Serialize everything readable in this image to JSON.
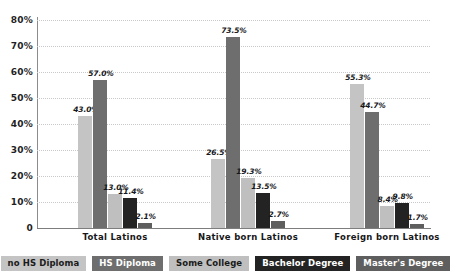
{
  "chart_data": {
    "type": "bar",
    "title": "",
    "subtitle": "",
    "xlabel": "",
    "ylabel": "",
    "ylim": [
      0,
      80
    ],
    "grid": true,
    "legend_position": "bottom",
    "categories": [
      "Total Latinos",
      "Native born Latinos",
      "Foreign born Latinos"
    ],
    "ytick_labels": [
      "80%",
      "70%",
      "60%",
      "50%",
      "40%",
      "30%",
      "20%",
      "10%",
      "0"
    ],
    "ytick_values": [
      80,
      70,
      60,
      50,
      40,
      30,
      20,
      10,
      0
    ],
    "series": [
      {
        "name": "no HS Diploma",
        "color": "#c4c4c4",
        "text_color": "#1a1a1a",
        "values": [
          43.0,
          26.5,
          55.3
        ],
        "labels": [
          "43.0%",
          "26.5%",
          "55.3%"
        ]
      },
      {
        "name": "HS Diploma",
        "color": "#6e6e6e",
        "text_color": "#ffffff",
        "values": [
          57.0,
          73.5,
          44.7
        ],
        "labels": [
          "57.0%",
          "73.5%",
          "44.7%"
        ]
      },
      {
        "name": "Some College",
        "color": "#bfbfbf",
        "text_color": "#1a1a1a",
        "values": [
          13.0,
          19.3,
          8.4
        ],
        "labels": [
          "13.0%",
          "19.3%",
          "8.4%"
        ]
      },
      {
        "name": "Bachelor Degree",
        "color": "#232323",
        "text_color": "#ffffff",
        "values": [
          11.4,
          13.5,
          9.8
        ],
        "labels": [
          "11.4%",
          "13.5%",
          "9.8%"
        ]
      },
      {
        "name": "Master's Degree",
        "color": "#5e5e5e",
        "text_color": "#ffffff",
        "values": [
          2.1,
          2.7,
          1.7
        ],
        "labels": [
          "2.1%",
          "2.7%",
          "1.7%"
        ]
      }
    ]
  },
  "legend": {
    "items": [
      {
        "label": "no HS Diploma"
      },
      {
        "label": "HS Diploma"
      },
      {
        "label": "Some College"
      },
      {
        "label": "Bachelor Degree"
      },
      {
        "label": "Master's Degree"
      }
    ]
  }
}
